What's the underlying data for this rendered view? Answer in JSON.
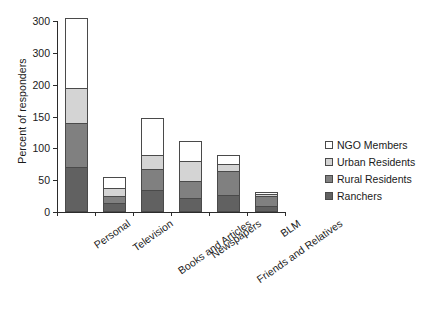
{
  "chart_data": {
    "type": "bar",
    "subtype": "stacked-bar",
    "title": "",
    "xlabel": "",
    "ylabel": "Percent of responders",
    "ylim": [
      0,
      300
    ],
    "yticks": [
      0,
      50,
      100,
      150,
      200,
      300,
      300
    ],
    "ytick_labels": [
      "0",
      "50",
      "100",
      "150",
      "200",
      "300",
      "300"
    ],
    "grid": false,
    "legend_position": "right",
    "categories": [
      "Personal",
      "Television",
      "Books and Articles",
      "Newspapers",
      "Friends and Relatives",
      "BLM"
    ],
    "series": [
      {
        "name": "Ranchers",
        "color": "#616161",
        "values": [
          70,
          14,
          35,
          22,
          27,
          10
        ]
      },
      {
        "name": "Rural Residents",
        "color": "#808080",
        "values": [
          70,
          11,
          33,
          27,
          37,
          15
        ]
      },
      {
        "name": "Urban Residents",
        "color": "#d4d4d4",
        "values": [
          55,
          13,
          22,
          31,
          12,
          4
        ]
      },
      {
        "name": "NGO Members",
        "color": "#ffffff",
        "values": [
          110,
          17,
          58,
          32,
          14,
          3
        ]
      }
    ],
    "totals": [
      305,
      55,
      148,
      112,
      90,
      32
    ]
  },
  "legend": {
    "entries": [
      {
        "label": "NGO Members",
        "color": "#ffffff"
      },
      {
        "label": "Urban Residents",
        "color": "#d4d4d4"
      },
      {
        "label": "Rural Residents",
        "color": "#808080"
      },
      {
        "label": "Ranchers",
        "color": "#616161"
      }
    ]
  },
  "axis": {
    "y_title": "Percent of responders"
  }
}
